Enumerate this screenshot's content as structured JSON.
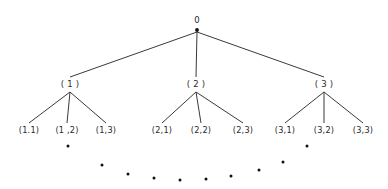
{
  "diagram": {
    "type": "tree",
    "title": "",
    "background_color": "#ffffff",
    "line_color": "#3a3a3a",
    "text_color": "#2a2a2a",
    "dot_color": "#111111",
    "root": {
      "label": "0",
      "x": 197,
      "y": 30,
      "label_x": 197,
      "label_y": 23
    },
    "level1": [
      {
        "label": "( 1 )",
        "x": 70,
        "y": 84,
        "label_x": 70,
        "label_y": 87
      },
      {
        "label": "( 2 )",
        "x": 196,
        "y": 84,
        "label_x": 196,
        "label_y": 87
      },
      {
        "label": "( 3 )",
        "x": 324,
        "y": 84,
        "label_x": 324,
        "label_y": 87
      }
    ],
    "level2": [
      {
        "label": "(1.1)",
        "parent": 0,
        "x": 29,
        "y": 130,
        "label_x": 29,
        "label_y": 133
      },
      {
        "label": "(1 ,2)",
        "parent": 0,
        "x": 67,
        "y": 130,
        "label_x": 67,
        "label_y": 133
      },
      {
        "label": "(1,3)",
        "parent": 0,
        "x": 106,
        "y": 130,
        "label_x": 106,
        "label_y": 133
      },
      {
        "label": "(2,1)",
        "parent": 1,
        "x": 162,
        "y": 130,
        "label_x": 162,
        "label_y": 133
      },
      {
        "label": "(2,2)",
        "parent": 1,
        "x": 201,
        "y": 130,
        "label_x": 201,
        "label_y": 133
      },
      {
        "label": "(2,3)",
        "parent": 1,
        "x": 243,
        "y": 130,
        "label_x": 243,
        "label_y": 133
      },
      {
        "label": "(3,1)",
        "parent": 2,
        "x": 285,
        "y": 130,
        "label_x": 285,
        "label_y": 133
      },
      {
        "label": "(3,2)",
        "parent": 2,
        "x": 324,
        "y": 130,
        "label_x": 324,
        "label_y": 133
      },
      {
        "label": "(3,3)",
        "parent": 2,
        "x": 363,
        "y": 130,
        "label_x": 363,
        "label_y": 133
      }
    ],
    "level1_edge_tops": {
      "x": 197,
      "y": 32
    },
    "level1_edge_bottoms_y": 77,
    "level2_edge_tops_y": 92,
    "level2_edge_bottoms_y": 123,
    "ellipsis_dots": [
      {
        "x": 68,
        "y": 146
      },
      {
        "x": 102,
        "y": 165
      },
      {
        "x": 128,
        "y": 174
      },
      {
        "x": 154,
        "y": 178
      },
      {
        "x": 180,
        "y": 180
      },
      {
        "x": 206,
        "y": 179
      },
      {
        "x": 231,
        "y": 176
      },
      {
        "x": 259,
        "y": 170
      },
      {
        "x": 283,
        "y": 162
      },
      {
        "x": 307,
        "y": 146
      }
    ],
    "node_dot_radius": 1.9,
    "ellipsis_dot_radius": 1.5
  }
}
